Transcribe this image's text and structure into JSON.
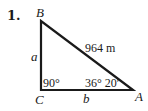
{
  "problem": {
    "number": "1."
  },
  "triangle": {
    "vertices": {
      "A": "A",
      "B": "B",
      "C": "C"
    },
    "sides": {
      "a": "a",
      "b": "b",
      "hypotenuse": "964 m"
    },
    "angles": {
      "C": "90°",
      "A": "36° 20′"
    },
    "stroke_color": "#1a1a1a"
  }
}
